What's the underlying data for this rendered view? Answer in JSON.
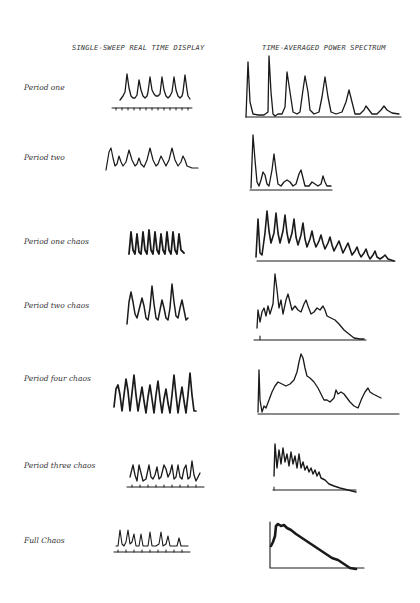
{
  "headers": {
    "left": "SINGLE-SWEEP REAL TIME DISPLAY",
    "right": "TIME-AVERAGED POWER SPECTRUM"
  },
  "rows": [
    {
      "id": "period-one",
      "label": "Period one"
    },
    {
      "id": "period-two",
      "label": "Period two"
    },
    {
      "id": "period-one-chaos",
      "label": "Period one chaos"
    },
    {
      "id": "period-two-chaos",
      "label": "Period two chaos"
    },
    {
      "id": "period-four-chaos",
      "label": "Period four chaos"
    },
    {
      "id": "period-three-chaos",
      "label": "Period three chaos"
    },
    {
      "id": "full-chaos",
      "label": "Full Chaos"
    }
  ],
  "colors": {
    "ink": "#1a1a1a",
    "paper": "#ffffff"
  }
}
